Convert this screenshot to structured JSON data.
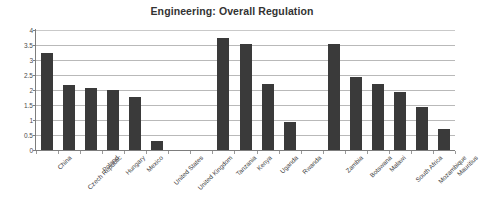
{
  "chart_data": {
    "type": "bar",
    "title": "Engineering: Overall Regulation",
    "xlabel": "",
    "ylabel": "",
    "ylim": [
      0,
      4
    ],
    "yticks": [
      0,
      0.5,
      1,
      1.5,
      2,
      2.5,
      3,
      3.5,
      4
    ],
    "ytick_labels": [
      "0",
      "0.5",
      "1",
      "1.5",
      "2",
      "2.5",
      "3",
      "3.5",
      "4"
    ],
    "grid": true,
    "legend": false,
    "bar_color": "#3a3a3a",
    "gridline_color": "#b9b9b9",
    "background_color": "#ffffff",
    "categories": [
      "China",
      "Czech Republic",
      "Poland",
      "Hungary",
      "Mexico",
      "United States",
      "United Kingdom",
      "",
      "Tanzania",
      "Kenya",
      "Uganda",
      "Rwanda",
      "",
      "Zambia",
      "Botswana",
      "Malawi",
      "South Africa",
      "Mozambique",
      "Mauritius"
    ],
    "values": [
      3.23,
      2.17,
      2.06,
      1.99,
      1.78,
      0.3,
      0,
      0,
      3.73,
      3.53,
      2.2,
      0.95,
      0,
      3.53,
      2.45,
      2.2,
      1.95,
      1.43,
      0.7
    ]
  }
}
